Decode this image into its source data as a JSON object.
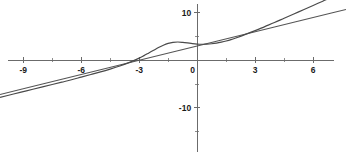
{
  "chart_data": {
    "type": "line",
    "title": "",
    "subtitle": "",
    "xlabel": "",
    "ylabel": "",
    "xlim": [
      -10.2,
      7.7
    ],
    "ylim": [
      -21.0,
      12.7
    ],
    "grid": false,
    "legend": "none",
    "background_color": "#ffffff",
    "axis_color": "#6b6b6b",
    "xticks": [
      -9,
      -6,
      -3,
      0,
      3,
      6
    ],
    "xtick_labels": [
      "-9",
      "-6",
      "-3",
      "0",
      "3",
      "6"
    ],
    "xticks_minor": [
      -10.5,
      -7.5,
      -4.5,
      -1.5,
      1.5,
      4.5,
      7.5
    ],
    "yticks": [
      -10,
      0,
      10
    ],
    "ytick_labels": [
      "-10",
      "0",
      "10"
    ],
    "yticks_minor": [
      -15,
      -5,
      5
    ],
    "series": [
      {
        "name": "asymptote",
        "type": "line",
        "color": "#555555",
        "x": [
          -10.2,
          -9,
          -8,
          -7,
          -6,
          -5,
          -4,
          -3,
          -2,
          -1,
          0,
          1,
          2,
          3,
          4,
          5,
          6,
          7,
          7.7
        ],
        "values": [
          -7.2,
          -6.0,
          -5.0,
          -4.0,
          -3.0,
          -2.0,
          -1.0,
          0.0,
          1.0,
          2.0,
          3.0,
          4.0,
          5.0,
          6.0,
          7.0,
          8.0,
          9.0,
          10.0,
          10.7
        ]
      },
      {
        "name": "function",
        "type": "curve",
        "color": "#4a4a4a",
        "x": [
          -10.2,
          -9.5,
          -9,
          -8.5,
          -8,
          -7.5,
          -7,
          -6.5,
          -6,
          -5.5,
          -5,
          -4.5,
          -4,
          -3.5,
          -3,
          -2.75,
          -2.5,
          -2.25,
          -2,
          -1.75,
          -1.5,
          -1.25,
          -1,
          -0.75,
          -0.5,
          -0.25,
          0,
          0.25,
          0.5,
          0.75,
          1,
          1.25,
          1.5,
          1.75,
          2,
          2.5,
          3,
          3.5,
          4,
          4.5,
          5,
          5.5,
          6,
          6.5,
          7,
          7.7
        ],
        "values": [
          -7.8,
          -7.1,
          -6.6,
          -6.1,
          -5.6,
          -5.1,
          -4.6,
          -4.1,
          -3.55,
          -3.0,
          -2.45,
          -1.85,
          -1.2,
          -0.45,
          0.45,
          0.98,
          1.55,
          2.12,
          2.68,
          3.18,
          3.56,
          3.78,
          3.85,
          3.78,
          3.66,
          3.52,
          3.42,
          3.38,
          3.4,
          3.48,
          3.62,
          3.82,
          4.06,
          4.35,
          4.7,
          5.45,
          6.25,
          7.1,
          7.95,
          8.85,
          9.75,
          10.65,
          11.55,
          12.45,
          13.35,
          14.0
        ]
      }
    ]
  }
}
